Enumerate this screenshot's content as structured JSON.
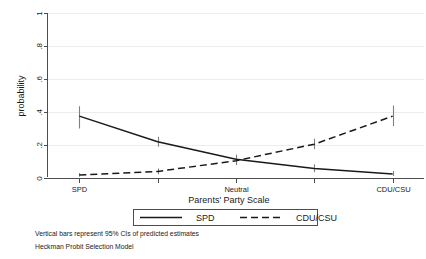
{
  "chart_data": {
    "type": "line",
    "title": "",
    "xlabel": "Parents' Party Scale",
    "ylabel": "probability",
    "x": [
      1,
      2,
      3,
      4,
      5
    ],
    "categories": [
      "SPD",
      "",
      "Neutral",
      "",
      "CDU/CSU"
    ],
    "xtick_labels": [
      "SPD",
      "Neutral",
      "CDU/CSU"
    ],
    "ytick_labels": [
      "0",
      ".2",
      ".4",
      ".6",
      ".8",
      "1"
    ],
    "ytick_values": [
      0,
      0.2,
      0.4,
      0.6,
      0.8,
      1
    ],
    "ylim": [
      0,
      1
    ],
    "xlim": [
      0.6,
      5.4
    ],
    "grid": "horizontal",
    "legend_position": "bottom-center",
    "series": [
      {
        "name": "SPD",
        "style": "solid",
        "values": [
          0.375,
          0.22,
          0.113,
          0.058,
          0.025
        ],
        "ci_low": [
          0.3,
          0.19,
          0.085,
          0.035,
          0.012
        ],
        "ci_high": [
          0.435,
          0.25,
          0.142,
          0.083,
          0.042
        ]
      },
      {
        "name": "CDU/CSU",
        "style": "dashed",
        "values": [
          0.018,
          0.04,
          0.105,
          0.205,
          0.375
        ],
        "ci_low": [
          0.008,
          0.022,
          0.078,
          0.175,
          0.315
        ],
        "ci_high": [
          0.03,
          0.058,
          0.133,
          0.238,
          0.44
        ]
      }
    ],
    "annotations": [
      "Vertical bars represent 95% CIs of predicted estimates",
      "Heckman Probit Selection Model"
    ]
  },
  "legend": {
    "entries": [
      {
        "label": "SPD",
        "style": "solid"
      },
      {
        "label": "CDU/CSU",
        "style": "dashed"
      }
    ]
  },
  "notes": {
    "line1": "Vertical bars represent 95% CIs of predicted estimates",
    "line2": "Heckman Probit Selection Model"
  },
  "axes": {
    "y_title": "probability",
    "x_title": "Parents' Party Scale"
  },
  "colors": {
    "series_line": "#1a1a1a",
    "error_bar": "#808080",
    "gridline": "#ececec",
    "axis": "#4d4d4d",
    "background": "#ffffff"
  }
}
